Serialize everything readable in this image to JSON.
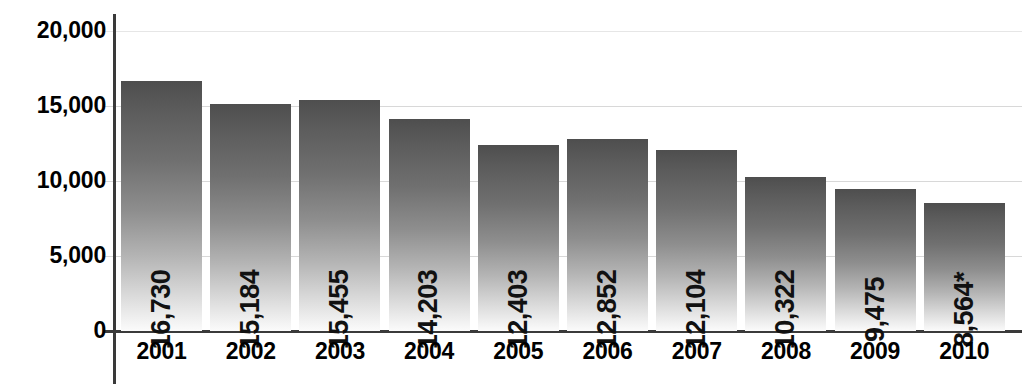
{
  "chart_data": {
    "type": "bar",
    "title": "",
    "xlabel": "",
    "ylabel": "",
    "categories": [
      "2001",
      "2002",
      "2003",
      "2004",
      "2005",
      "2006",
      "2007",
      "2008",
      "2009",
      "2010"
    ],
    "values": [
      16730,
      15184,
      15455,
      14203,
      12403,
      12852,
      12104,
      10322,
      9475,
      8564
    ],
    "value_labels": [
      "16,730",
      "15,184",
      "15,455",
      "14,203",
      "12,403",
      "12,852",
      "12,104",
      "10,322",
      "9,475",
      "8,564*"
    ],
    "ylim": [
      0,
      20000
    ],
    "ytick_values": [
      0,
      5000,
      10000,
      15000,
      20000
    ],
    "ytick_labels": [
      "0",
      "5,000",
      "10,000",
      "15,000",
      "20,000"
    ],
    "grid": true,
    "legend": "none",
    "series": [
      {
        "name": "",
        "values": [
          16730,
          15184,
          15455,
          14203,
          12403,
          12852,
          12104,
          10322,
          9475,
          8564
        ]
      }
    ],
    "annotations": [
      "* asterisk on 2010 value"
    ],
    "colors": {
      "bar_top": "#4e4e4e",
      "bar_bottom": "#fbfbfb",
      "axis": "#3a3a3a",
      "gridline": "#d8d8d8",
      "text": "#000000",
      "background": "#ffffff"
    }
  },
  "axis": {
    "y_ticks": [
      {
        "label": "20,000",
        "value": 20000
      },
      {
        "label": "15,000",
        "value": 15000
      },
      {
        "label": "10,000",
        "value": 10000
      },
      {
        "label": "5,000",
        "value": 5000
      },
      {
        "label": "0",
        "value": 0
      }
    ],
    "x_ticks": [
      "2001",
      "2002",
      "2003",
      "2004",
      "2005",
      "2006",
      "2007",
      "2008",
      "2009",
      "2010"
    ]
  },
  "title_remnant": ""
}
